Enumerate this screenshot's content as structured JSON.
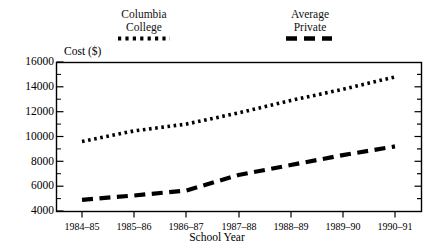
{
  "chart_data": {
    "type": "line",
    "title": "",
    "xlabel": "School Year",
    "ylabel": "Cost ($)",
    "categories": [
      "1984–85",
      "1985–86",
      "1986–87",
      "1987–88",
      "1988–89",
      "1989–90",
      "1990–91"
    ],
    "ylim": [
      4000,
      16000
    ],
    "yticks": [
      4000,
      6000,
      8000,
      10000,
      12000,
      14000,
      16000
    ],
    "ytick_labels": [
      "4000",
      "6000",
      "8000",
      "10000",
      "12000",
      "14000",
      "16000"
    ],
    "minor_ytick_interval": 1000,
    "grid": false,
    "legend_position": "above-plot",
    "series": [
      {
        "name": "Columbia College",
        "style": "dotted",
        "color": "#000000",
        "values": [
          9600,
          10450,
          11000,
          11900,
          12900,
          13800,
          14800
        ]
      },
      {
        "name": "Average Private",
        "style": "dashed",
        "color": "#000000",
        "values": [
          4900,
          5250,
          5650,
          6900,
          7700,
          8500,
          9200
        ]
      }
    ]
  },
  "legend": {
    "columbia": {
      "line1": "Columbia",
      "line2": "College",
      "swatch": "dotted-line-swatch"
    },
    "private": {
      "line1": "Average",
      "line2": "Private",
      "swatch": "dashed-line-swatch"
    }
  },
  "axes": {
    "y_title": "Cost ($)",
    "x_title": "School Year"
  }
}
